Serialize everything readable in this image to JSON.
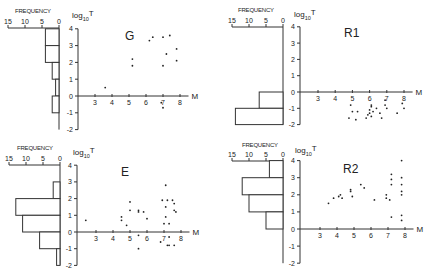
{
  "figure": {
    "x_axis_label": "M",
    "y_axis_label_base": "log",
    "y_axis_label_sub": "10",
    "y_axis_label_var": "T",
    "histogram_label": "FREQUENCY",
    "histogram_ticks": [
      "15",
      "10",
      "5",
      "0"
    ],
    "y_ticks": [
      "4",
      "3",
      "2",
      "1",
      "0",
      "-1",
      "-2"
    ],
    "x_ticks": [
      "3",
      "4",
      "5",
      "6",
      "7",
      "8"
    ]
  },
  "chart_data": [
    {
      "type": "scatter",
      "title": "G",
      "xlabel": "M",
      "ylabel": "log10 T",
      "xlim": [
        2,
        8.5
      ],
      "ylim": [
        -2,
        4
      ],
      "grid": false,
      "histogram": {
        "label": "FREQUENCY",
        "range": [
          0,
          15
        ],
        "bins": [
          {
            "from": 3,
            "to": 4,
            "count": 4
          },
          {
            "from": 2,
            "to": 3,
            "count": 4
          },
          {
            "from": 1,
            "to": 2,
            "count": 2
          },
          {
            "from": 0,
            "to": 1,
            "count": 1
          },
          {
            "from": -1,
            "to": 0,
            "count": 2
          }
        ]
      },
      "points": [
        [
          3.6,
          0.5
        ],
        [
          5.2,
          2.2
        ],
        [
          5.2,
          1.8
        ],
        [
          6.2,
          3.3
        ],
        [
          6.4,
          3.5
        ],
        [
          7.0,
          3.5
        ],
        [
          7.4,
          3.6
        ],
        [
          7.8,
          2.8
        ],
        [
          7.2,
          2.5
        ],
        [
          7.8,
          2.1
        ],
        [
          7.0,
          1.8
        ],
        [
          6.9,
          -0.4
        ],
        [
          7.0,
          -0.7
        ]
      ]
    },
    {
      "type": "scatter",
      "title": "R1",
      "xlabel": "M",
      "ylabel": "log10 T",
      "xlim": [
        2,
        8.5
      ],
      "ylim": [
        -2,
        4
      ],
      "grid": false,
      "histogram": {
        "label": "FREQUENCY",
        "range": [
          0,
          15
        ],
        "bins": [
          {
            "from": -1,
            "to": 0,
            "count": 7
          },
          {
            "from": -2,
            "to": -1,
            "count": 14
          }
        ]
      },
      "points": [
        [
          4.9,
          -0.8
        ],
        [
          5.0,
          -1.2
        ],
        [
          5.3,
          -1.2
        ],
        [
          4.8,
          -1.6
        ],
        [
          5.2,
          -1.7
        ],
        [
          6.1,
          -0.8
        ],
        [
          6.1,
          -0.9
        ],
        [
          6.0,
          -1.1
        ],
        [
          6.2,
          -1.2
        ],
        [
          6.4,
          -1.0
        ],
        [
          5.9,
          -1.4
        ],
        [
          6.0,
          -1.3
        ],
        [
          5.8,
          -1.6
        ],
        [
          6.1,
          -1.5
        ],
        [
          6.6,
          -1.3
        ],
        [
          6.7,
          -1.6
        ],
        [
          6.9,
          -0.5
        ],
        [
          6.9,
          -0.8
        ],
        [
          7.0,
          -1.0
        ],
        [
          7.9,
          -0.7
        ],
        [
          8.0,
          -1.0
        ],
        [
          7.6,
          -1.3
        ]
      ]
    },
    {
      "type": "scatter",
      "title": "E",
      "xlabel": "M",
      "ylabel": "log10 T",
      "xlim": [
        2,
        8.5
      ],
      "ylim": [
        -2,
        4
      ],
      "grid": false,
      "histogram": {
        "label": "FREQUENCY",
        "range": [
          0,
          15
        ],
        "bins": [
          {
            "from": 2,
            "to": 3,
            "count": 2
          },
          {
            "from": 1,
            "to": 2,
            "count": 13
          },
          {
            "from": 0,
            "to": 1,
            "count": 11
          },
          {
            "from": -1,
            "to": 0,
            "count": 6
          },
          {
            "from": -2,
            "to": -1,
            "count": 1
          }
        ]
      },
      "points": [
        [
          2.4,
          0.7
        ],
        [
          4.5,
          0.9
        ],
        [
          4.5,
          0.7
        ],
        [
          4.8,
          0.4
        ],
        [
          5.0,
          1.8
        ],
        [
          5.0,
          1.3
        ],
        [
          5.5,
          1.2
        ],
        [
          5.5,
          1.3
        ],
        [
          5.8,
          1.2
        ],
        [
          6.0,
          0.8
        ],
        [
          5.5,
          -0.2
        ],
        [
          5.5,
          -1.0
        ],
        [
          7.1,
          2.8
        ],
        [
          6.9,
          1.9
        ],
        [
          7.2,
          1.9
        ],
        [
          7.5,
          1.9
        ],
        [
          7.6,
          1.7
        ],
        [
          7.1,
          1.5
        ],
        [
          7.6,
          1.3
        ],
        [
          7.7,
          1.2
        ],
        [
          7.1,
          0.9
        ],
        [
          7.0,
          0.5
        ],
        [
          7.3,
          0.5
        ],
        [
          7.3,
          -0.3
        ],
        [
          6.8,
          -0.6
        ],
        [
          7.2,
          -0.8
        ],
        [
          7.3,
          -0.8
        ],
        [
          7.6,
          -0.8
        ]
      ]
    },
    {
      "type": "scatter",
      "title": "R2",
      "xlabel": "M",
      "ylabel": "log10 T",
      "xlim": [
        2,
        8.5
      ],
      "ylim": [
        -2,
        4
      ],
      "grid": false,
      "histogram": {
        "label": "FREQUENCY",
        "range": [
          0,
          15
        ],
        "bins": [
          {
            "from": 3,
            "to": 4,
            "count": 4
          },
          {
            "from": 2,
            "to": 3,
            "count": 12
          },
          {
            "from": 1,
            "to": 2,
            "count": 10
          },
          {
            "from": 0,
            "to": 1,
            "count": 5
          }
        ]
      },
      "points": [
        [
          3.5,
          1.5
        ],
        [
          3.8,
          1.8
        ],
        [
          4.1,
          1.9
        ],
        [
          4.2,
          2.0
        ],
        [
          4.3,
          1.8
        ],
        [
          4.8,
          2.2
        ],
        [
          4.8,
          2.3
        ],
        [
          4.9,
          1.9
        ],
        [
          5.4,
          2.6
        ],
        [
          5.6,
          2.4
        ],
        [
          6.2,
          1.7
        ],
        [
          6.9,
          2.0
        ],
        [
          6.9,
          1.8
        ],
        [
          7.1,
          1.7
        ],
        [
          7.2,
          3.2
        ],
        [
          7.2,
          2.9
        ],
        [
          7.2,
          2.6
        ],
        [
          7.8,
          4.0
        ],
        [
          7.8,
          3.0
        ],
        [
          7.8,
          2.6
        ],
        [
          7.8,
          2.2
        ],
        [
          7.8,
          2.0
        ],
        [
          7.2,
          0.7
        ],
        [
          7.8,
          0.8
        ],
        [
          7.8,
          0.5
        ]
      ]
    }
  ],
  "layout": [
    {
      "yaxis_x": 78,
      "y0": 96,
      "unit_y": 16.8,
      "m3_x": 95,
      "unit_x": 17,
      "hist_zero_x": 59,
      "hist_unit": 3.4,
      "label_x": 125,
      "label_y": 40,
      "freq_label_x": 15,
      "freq_label_y": 13,
      "hist_ticks_y": 24,
      "ylab_x": 72,
      "ylab_y": 18
    },
    {
      "yaxis_x": 300,
      "y0": 92,
      "unit_y": 16.3,
      "m3_x": 318,
      "unit_x": 17.2,
      "hist_zero_x": 283,
      "hist_unit": 3.4,
      "label_x": 344,
      "label_y": 37,
      "freq_label_x": 238,
      "freq_label_y": 12,
      "hist_ticks_y": 23,
      "ylab_x": 294,
      "ylab_y": 17
    },
    {
      "yaxis_x": 77,
      "y0": 232,
      "unit_y": 16.7,
      "m3_x": 96,
      "unit_x": 17,
      "hist_zero_x": 60,
      "hist_unit": 3.4,
      "label_x": 121,
      "label_y": 176,
      "freq_label_x": 17,
      "freq_label_y": 150,
      "hist_ticks_y": 161,
      "ylab_x": 73,
      "ylab_y": 155
    },
    {
      "yaxis_x": 300,
      "y0": 229,
      "unit_y": 17.1,
      "m3_x": 320,
      "unit_x": 17,
      "hist_zero_x": 283,
      "hist_unit": 3.4,
      "label_x": 343,
      "label_y": 173,
      "freq_label_x": 242,
      "freq_label_y": 147,
      "hist_ticks_y": 157,
      "ylab_x": 295,
      "ylab_y": 153
    }
  ]
}
